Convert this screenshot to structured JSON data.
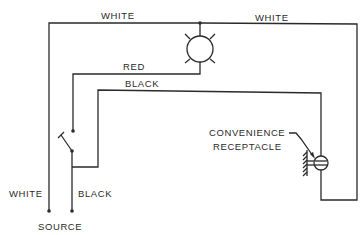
{
  "diagram": {
    "labels": {
      "top_left_white": "WHITE",
      "top_right_white": "WHITE",
      "red": "RED",
      "black_top": "BLACK",
      "receptacle_line1": "CONVENIENCE",
      "receptacle_line2": "RECEPTACLE",
      "left_white": "WHITE",
      "bottom_black": "BLACK",
      "source": "SOURCE"
    },
    "components": [
      {
        "id": "lamp",
        "type": "light-fixture"
      },
      {
        "id": "switch",
        "type": "single-pole-switch"
      },
      {
        "id": "receptacle",
        "type": "convenience-receptacle",
        "grounded": true
      },
      {
        "id": "source",
        "type": "power-source-terminals"
      }
    ],
    "wires": [
      {
        "color": "white",
        "from": "source",
        "to": "lamp"
      },
      {
        "color": "white",
        "from": "lamp",
        "to": "receptacle"
      },
      {
        "color": "red",
        "from": "lamp",
        "to": "switch"
      },
      {
        "color": "black",
        "from": "switch",
        "to": "receptacle"
      },
      {
        "color": "black",
        "from": "source",
        "to": "switch"
      }
    ],
    "line_color": "#2a2a2a"
  }
}
